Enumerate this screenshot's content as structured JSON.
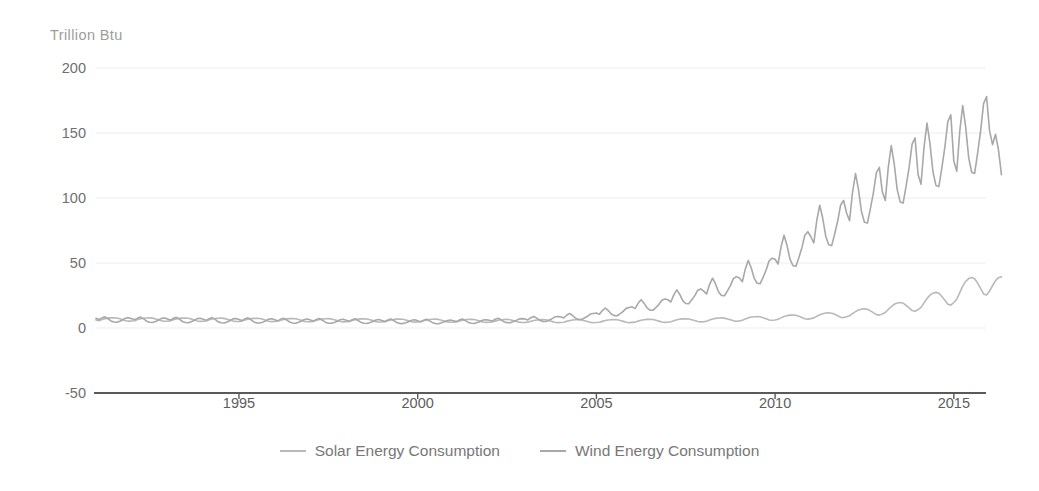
{
  "chart_data": {
    "type": "line",
    "title": "",
    "subtitle": "",
    "xlabel": "",
    "ylabel": "Trillion Btu",
    "ylim": [
      -50,
      200
    ],
    "xlim": [
      1991.0,
      2015.9
    ],
    "grid": true,
    "legend_position": "bottom-center",
    "y_ticks": [
      200,
      150,
      100,
      50,
      0,
      -50
    ],
    "x_ticks": [
      1995,
      2000,
      2005,
      2010,
      2015
    ],
    "x_tick_labels": [
      "1995",
      "2000",
      "2005",
      "2010",
      "2015"
    ],
    "y_tick_labels": [
      "200",
      "150",
      "100",
      "50",
      "0",
      "-50"
    ],
    "colors": {
      "solar_line": "#b9b9b9",
      "wind_line": "#a8a8a8",
      "gridline": "#ededed",
      "axis_line": "#5a5a5a",
      "tick_text": "#6f6f6f",
      "unit_label": "#9d9d9d",
      "legend_text": "#777777"
    },
    "series": [
      {
        "name": "Solar Energy Consumption",
        "x_start": 1991.0,
        "x_step": 0.08333,
        "values": [
          6.2,
          5.6,
          6.6,
          7.2,
          7.6,
          7.8,
          7.9,
          7.7,
          7.1,
          6.4,
          5.6,
          5.3,
          5.4,
          5.6,
          6.5,
          7.1,
          7.5,
          7.7,
          7.8,
          7.6,
          7.0,
          6.3,
          5.5,
          5.2,
          5.3,
          5.5,
          6.4,
          7.0,
          7.4,
          7.6,
          7.7,
          7.5,
          6.9,
          6.2,
          5.4,
          5.1,
          5.2,
          5.4,
          6.3,
          6.9,
          7.3,
          7.5,
          7.6,
          7.4,
          6.8,
          6.1,
          5.3,
          5.0,
          5.1,
          5.3,
          6.2,
          6.8,
          7.2,
          7.4,
          7.5,
          7.3,
          6.7,
          6.0,
          5.2,
          4.9,
          5.0,
          5.2,
          6.0,
          6.6,
          7.0,
          7.2,
          7.3,
          7.1,
          6.5,
          5.9,
          5.1,
          4.8,
          4.9,
          5.1,
          5.9,
          6.5,
          6.9,
          7.1,
          7.2,
          7.0,
          6.4,
          5.8,
          5.0,
          4.7,
          4.8,
          5.0,
          5.8,
          6.4,
          6.8,
          7.0,
          7.1,
          6.9,
          6.3,
          5.7,
          4.9,
          4.6,
          4.7,
          4.9,
          5.6,
          6.2,
          6.6,
          6.8,
          6.9,
          6.7,
          6.1,
          5.5,
          4.8,
          4.5,
          4.6,
          4.8,
          5.5,
          6.1,
          6.5,
          6.7,
          6.8,
          6.6,
          6.0,
          5.4,
          4.7,
          4.4,
          4.5,
          4.7,
          5.4,
          6.0,
          6.4,
          6.6,
          6.7,
          6.5,
          5.9,
          5.3,
          4.6,
          4.3,
          4.4,
          4.6,
          5.3,
          5.9,
          6.3,
          6.5,
          6.6,
          6.4,
          5.8,
          5.2,
          4.5,
          4.2,
          4.3,
          4.5,
          5.2,
          5.8,
          6.2,
          6.4,
          6.5,
          6.3,
          5.7,
          5.1,
          4.4,
          4.1,
          4.2,
          4.4,
          5.1,
          5.7,
          6.1,
          6.3,
          6.4,
          6.2,
          5.6,
          5.0,
          4.3,
          4.0,
          4.2,
          4.4,
          5.1,
          5.7,
          6.2,
          6.4,
          6.5,
          6.3,
          5.7,
          5.1,
          4.4,
          4.1,
          4.3,
          4.5,
          5.3,
          5.9,
          6.4,
          6.6,
          6.7,
          6.5,
          5.9,
          5.3,
          4.6,
          4.3,
          4.5,
          4.8,
          5.6,
          6.3,
          6.8,
          7.0,
          7.1,
          6.9,
          6.3,
          5.7,
          5.0,
          4.7,
          4.9,
          5.2,
          6.1,
          6.9,
          7.4,
          7.7,
          7.8,
          7.6,
          7.0,
          6.3,
          5.5,
          5.2,
          5.5,
          5.9,
          6.9,
          7.8,
          8.4,
          8.7,
          8.8,
          8.6,
          7.9,
          7.1,
          6.2,
          5.9,
          6.2,
          6.7,
          7.8,
          8.8,
          9.5,
          9.9,
          10.0,
          9.8,
          9.0,
          8.1,
          7.1,
          6.8,
          7.2,
          7.8,
          9.0,
          10.2,
          11.0,
          11.5,
          11.7,
          11.4,
          10.5,
          9.5,
          8.3,
          8.0,
          8.6,
          9.4,
          11.0,
          12.6,
          13.8,
          14.5,
          14.8,
          14.4,
          13.2,
          11.8,
          10.3,
          9.9,
          10.8,
          11.9,
          14.2,
          16.5,
          18.2,
          19.2,
          19.6,
          19.1,
          17.4,
          15.5,
          13.4,
          12.9,
          14.2,
          15.9,
          19.3,
          22.7,
          25.3,
          26.8,
          27.4,
          26.7,
          24.2,
          21.4,
          18.3,
          17.6,
          19.6,
          22.1,
          27.2,
          32.2,
          35.9,
          38.0,
          38.8,
          37.9,
          34.5,
          30.5,
          26.2,
          25.3,
          28.5,
          32.5,
          36.5,
          38.7,
          39.5
        ]
      },
      {
        "name": "Wind Energy Consumption",
        "x_start": 1991.0,
        "x_step": 0.08333,
        "values": [
          7.4,
          6.6,
          7.8,
          8.6,
          7.2,
          5.4,
          4.6,
          4.4,
          5.2,
          6.4,
          7.6,
          7.9,
          7.1,
          6.3,
          7.6,
          8.4,
          7.0,
          5.2,
          4.4,
          4.2,
          5.0,
          6.2,
          7.4,
          7.7,
          6.9,
          6.1,
          7.4,
          8.2,
          6.8,
          5.0,
          4.2,
          4.0,
          4.8,
          6.0,
          7.2,
          7.5,
          6.7,
          5.9,
          7.2,
          8.0,
          6.6,
          4.8,
          4.0,
          3.9,
          4.6,
          5.8,
          7.0,
          7.3,
          6.5,
          5.7,
          7.0,
          7.8,
          6.4,
          4.7,
          3.9,
          3.8,
          4.5,
          5.6,
          6.8,
          7.1,
          6.3,
          5.5,
          6.8,
          7.5,
          6.2,
          4.6,
          3.8,
          3.7,
          4.4,
          5.4,
          6.6,
          6.9,
          6.1,
          5.3,
          6.6,
          7.3,
          6.0,
          4.5,
          3.7,
          3.6,
          4.3,
          5.2,
          6.4,
          6.7,
          5.9,
          5.1,
          6.4,
          7.1,
          5.8,
          4.3,
          3.6,
          3.5,
          4.2,
          5.0,
          6.2,
          6.5,
          5.7,
          5.0,
          6.2,
          6.9,
          5.7,
          4.2,
          3.5,
          3.4,
          4.1,
          4.9,
          6.0,
          6.3,
          5.5,
          4.8,
          6.0,
          6.7,
          5.5,
          4.1,
          3.4,
          3.3,
          4.0,
          4.8,
          5.8,
          6.1,
          5.6,
          4.9,
          6.2,
          6.9,
          5.7,
          4.3,
          3.6,
          3.5,
          4.2,
          5.0,
          6.1,
          6.4,
          6.0,
          5.3,
          6.7,
          7.5,
          6.3,
          4.8,
          4.1,
          4.0,
          4.8,
          5.7,
          6.9,
          7.2,
          7.0,
          6.2,
          7.9,
          8.9,
          7.6,
          5.9,
          5.1,
          5.0,
          6.0,
          7.0,
          8.4,
          8.8,
          8.6,
          7.7,
          9.8,
          11.2,
          9.6,
          7.6,
          6.6,
          6.5,
          7.7,
          9.0,
          10.7,
          11.2,
          11.6,
          10.5,
          13.4,
          15.4,
          13.4,
          10.8,
          9.5,
          9.4,
          11.0,
          12.8,
          15.1,
          15.8,
          16.3,
          14.9,
          19.0,
          21.8,
          19.1,
          15.5,
          13.7,
          13.6,
          15.8,
          18.2,
          21.4,
          22.3,
          21.8,
          20.0,
          25.5,
          29.3,
          25.8,
          21.1,
          18.8,
          18.6,
          21.5,
          24.7,
          28.9,
          30.1,
          28.4,
          26.2,
          33.4,
          38.3,
          33.9,
          27.9,
          25.0,
          24.8,
          28.5,
          32.6,
          38.0,
          39.5,
          38.4,
          35.6,
          45.3,
          51.9,
          46.1,
          38.2,
          34.4,
          34.1,
          39.1,
          44.6,
          51.7,
          53.7,
          52.9,
          49.2,
          62.4,
          71.3,
          63.6,
          53.0,
          47.9,
          47.5,
          54.3,
          61.8,
          71.4,
          74.1,
          70.2,
          65.4,
          82.8,
          94.4,
          84.4,
          70.6,
          64.0,
          63.4,
          72.3,
          82.1,
          94.6,
          98.1,
          88.5,
          82.6,
          104.4,
          118.8,
          106.6,
          89.6,
          81.4,
          80.7,
          91.8,
          104.0,
          119.4,
          123.6,
          104.9,
          98.1,
          123.6,
          140.3,
          126.2,
          106.5,
          97.0,
          96.2,
          109.3,
          123.5,
          141.4,
          146.2,
          118.0,
          110.6,
          139.0,
          157.6,
          142.0,
          120.2,
          109.7,
          108.8,
          123.4,
          139.1,
          158.8,
          164.0,
          128.4,
          120.6,
          151.2,
          171.1,
          154.5,
          131.1,
          119.8,
          118.9,
          134.6,
          151.5,
          172.6,
          178.0,
          152.0,
          141.0,
          149.0,
          137.0,
          118.0
        ]
      }
    ]
  },
  "legend": {
    "items": [
      {
        "label": "Solar Energy Consumption",
        "color": "#b9b9b9"
      },
      {
        "label": "Wind Energy Consumption",
        "color": "#a8a8a8"
      }
    ]
  }
}
